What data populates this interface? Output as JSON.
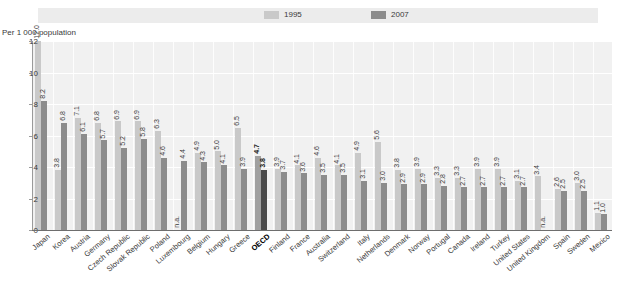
{
  "legend": {
    "entries": [
      {
        "label": "1995",
        "color": "#c9c9c9",
        "icon": "legend-swatch-icon"
      },
      {
        "label": "2007",
        "color": "#8c8c8c",
        "icon": "legend-swatch-icon"
      }
    ]
  },
  "axis": {
    "unit_note": "Per 1 000 population",
    "y_ticks": [
      "0",
      "2",
      "4",
      "6",
      "8",
      "10",
      "12"
    ]
  },
  "chart_data": {
    "type": "bar",
    "title": "",
    "subtitle": "",
    "xlabel": "",
    "ylabel": "Per 1 000 population",
    "ylim": [
      0,
      12
    ],
    "grid": true,
    "legend_position": "top",
    "categories": [
      "Japan",
      "Korea",
      "Austria",
      "Germany",
      "Czech Republic",
      "Slovak Republic",
      "Poland",
      "Luxembourg",
      "Belgium",
      "Hungary",
      "Greece",
      "OECD",
      "Finland",
      "France",
      "Australia",
      "Switzerland",
      "Italy",
      "Netherlands",
      "Denmark",
      "Norway",
      "Portugal",
      "Canada",
      "Ireland",
      "Turkey",
      "United States",
      "United Kingdom",
      "Spain",
      "Sweden",
      "Mexico"
    ],
    "highlight_category": "OECD",
    "series": [
      {
        "name": "1995",
        "color": "#c9c9c9",
        "values": [
          12.0,
          3.8,
          7.1,
          6.8,
          6.9,
          6.9,
          6.3,
          null,
          4.9,
          5.0,
          6.5,
          4.7,
          3.9,
          4.1,
          4.6,
          4.1,
          4.9,
          5.6,
          3.8,
          3.9,
          3.3,
          3.3,
          3.9,
          3.9,
          3.1,
          3.4,
          2.6,
          3.0,
          1.1
        ],
        "labels": [
          "12.0",
          "3.8",
          "7.1",
          "6.8",
          "6.9",
          "6.9",
          "6.3",
          "n.a.",
          "4.9",
          "5.0",
          "6.5",
          "4.7",
          "3.9",
          "4.1",
          "4.6",
          "4.1",
          "4.9",
          "5.6",
          "3.8",
          "3.9",
          "3.3",
          "3.3",
          "3.9",
          "3.9",
          "3.1",
          "3.4",
          "2.6",
          "3.0",
          "1.1"
        ]
      },
      {
        "name": "2007",
        "color": "#8c8c8c",
        "values": [
          8.2,
          6.8,
          6.1,
          5.7,
          5.2,
          5.8,
          4.6,
          4.4,
          4.3,
          4.1,
          3.9,
          3.8,
          3.7,
          3.6,
          3.5,
          3.5,
          3.1,
          3.0,
          2.9,
          2.9,
          2.8,
          2.7,
          2.7,
          2.7,
          2.7,
          null,
          2.5,
          2.5,
          1.0
        ],
        "labels": [
          "8.2",
          "6.8",
          "6.1",
          "5.7",
          "5.2",
          "5.8",
          "4.6",
          "4.4",
          "4.3",
          "4.1",
          "3.9",
          "3.8",
          "3.7",
          "3.6",
          "3.5",
          "3.5",
          "3.1",
          "3.0",
          "2.9",
          "2.9",
          "2.8",
          "2.7",
          "2.7",
          "2.7",
          "2.7",
          "n.a.",
          "2.5",
          "2.5",
          "1.0"
        ]
      }
    ]
  }
}
